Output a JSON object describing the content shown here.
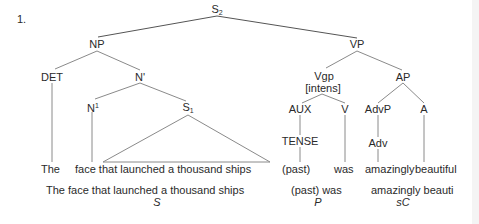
{
  "example_number": "1.",
  "tree": {
    "root": {
      "label": "S",
      "subscript": "2"
    },
    "np": {
      "label": "NP"
    },
    "det": {
      "label": "DET"
    },
    "nbar": {
      "label": "N'"
    },
    "n1": {
      "label": "N",
      "superscript": "1"
    },
    "s1": {
      "label": "S",
      "subscript": "1"
    },
    "vp": {
      "label": "VP"
    },
    "vgp": {
      "label": "Vgp",
      "feature": "[intens]"
    },
    "aux": {
      "label": "AUX"
    },
    "tense": {
      "label": "TENSE"
    },
    "v": {
      "label": "V"
    },
    "ap": {
      "label": "AP"
    },
    "advp": {
      "label": "AdvP"
    },
    "adv": {
      "label": "Adv"
    },
    "a": {
      "label": "A"
    }
  },
  "leaves": {
    "the": "The",
    "phrase": "face that launched a thousand ships",
    "past": "(past)",
    "was": "was",
    "amazingly": "amazingly",
    "beautiful": "beautiful"
  },
  "functions": {
    "subject_text": "The face that launched a thousand ships",
    "subject_tag": "S",
    "predicator_text": "(past) was",
    "predicator_tag": "P",
    "complement_text": "amazingly beauti",
    "complement_tag": "sC"
  },
  "colors": {
    "text": "#2a2a2a",
    "line": "#8a8a8a",
    "root_line": "#555555"
  }
}
